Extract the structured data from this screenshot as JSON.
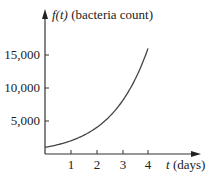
{
  "chart_data": {
    "type": "line",
    "title": "",
    "xlabel": "t (days)",
    "ylabel": "f(t) (bacteria count)",
    "xlabel_var": "t",
    "xlabel_unit": "(days)",
    "ylabel_var": "f(t)",
    "ylabel_unit": "(bacteria count)",
    "x_ticks": [
      "1",
      "2",
      "3",
      "4"
    ],
    "y_ticks": [
      "5,000",
      "10,000",
      "15,000"
    ],
    "xlim": [
      0,
      4.9
    ],
    "ylim": [
      0,
      18000
    ],
    "grid": false,
    "legend": null,
    "series": [
      {
        "name": "f(t)",
        "x": [
          0,
          0.5,
          1,
          1.5,
          2,
          2.5,
          3,
          3.5,
          4
        ],
        "y": [
          1000,
          1414,
          2000,
          2828,
          4000,
          5657,
          8000,
          11314,
          16000
        ]
      }
    ]
  }
}
